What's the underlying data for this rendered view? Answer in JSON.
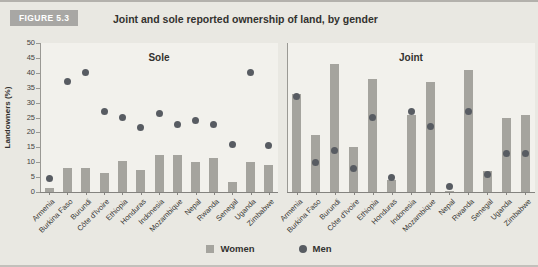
{
  "header": {
    "figure_label": "FIGURE 5.3",
    "title": "Joint and sole reported ownership of land, by gender"
  },
  "chart_data": {
    "type": "bar",
    "ylabel": "Landowners (%)",
    "ylim": [
      0,
      50
    ],
    "yticks": [
      0,
      5,
      10,
      15,
      20,
      25,
      30,
      35,
      40,
      45,
      50
    ],
    "grid": false,
    "legend_position": "bottom-center",
    "categories": [
      "Armenia",
      "Burkina Faso",
      "Burundi",
      "Côte d'Ivoire",
      "Ethiopia",
      "Honduras",
      "Indonesia",
      "Mozambique",
      "Nepal",
      "Rwanda",
      "Senegal",
      "Uganda",
      "Zimbabwe"
    ],
    "panels": [
      {
        "title": "Sole",
        "series": [
          {
            "name": "Women",
            "marker": "bar",
            "values": [
              1.5,
              8,
              8,
              6.5,
              10.5,
              7.5,
              12.5,
              12.5,
              10,
              11.5,
              3.5,
              10,
              9
            ]
          },
          {
            "name": "Men",
            "marker": "dot",
            "values": [
              4.5,
              37,
              40,
              27,
              25,
              21.5,
              26.5,
              22.5,
              24,
              22.5,
              16,
              40,
              15.5
            ]
          }
        ]
      },
      {
        "title": "Joint",
        "series": [
          {
            "name": "Women",
            "marker": "bar",
            "values": [
              33,
              19,
              43,
              15,
              38,
              4,
              26,
              37,
              0.5,
              41,
              7,
              25,
              26
            ]
          },
          {
            "name": "Men",
            "marker": "dot",
            "values": [
              32,
              10,
              14,
              8,
              25,
              5,
              27,
              22,
              2,
              27,
              6,
              13,
              13
            ]
          }
        ]
      }
    ],
    "colors": {
      "women_bar": "#a5a49e",
      "men_dot": "#585c62",
      "panel_bg": "#f2f1ec",
      "figure_bg": "#e9e8e2"
    }
  },
  "legend": {
    "women": "Women",
    "men": "Men"
  }
}
